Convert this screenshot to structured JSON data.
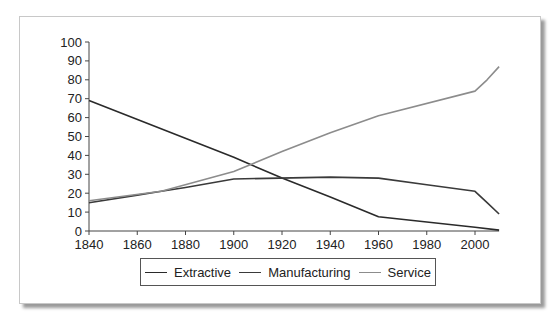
{
  "chart_data": {
    "type": "line",
    "title": "",
    "xlabel": "",
    "ylabel": "",
    "xlim": [
      1840,
      2010
    ],
    "ylim": [
      0,
      100
    ],
    "grid": false,
    "legend_position": "bottom",
    "x_ticks": [
      1840,
      1860,
      1880,
      1900,
      1920,
      1940,
      1960,
      1980,
      2000
    ],
    "y_ticks": [
      0,
      10,
      20,
      30,
      40,
      50,
      60,
      70,
      80,
      90,
      100
    ],
    "series": [
      {
        "name": "Extractive",
        "color": "#2a2a2a",
        "points": [
          [
            1840,
            69
          ],
          [
            1900,
            39
          ],
          [
            1920,
            28
          ],
          [
            1940,
            18
          ],
          [
            1960,
            7.5
          ],
          [
            2000,
            2
          ],
          [
            2010,
            0.5
          ]
        ]
      },
      {
        "name": "Manufacturing",
        "color": "#3a3a3a",
        "points": [
          [
            1840,
            15
          ],
          [
            1860,
            19
          ],
          [
            1870,
            21
          ],
          [
            1880,
            23
          ],
          [
            1900,
            27.5
          ],
          [
            1940,
            28.5
          ],
          [
            1960,
            28
          ],
          [
            1980,
            24.5
          ],
          [
            2000,
            21
          ],
          [
            2005,
            15
          ],
          [
            2010,
            9
          ]
        ]
      },
      {
        "name": "Service",
        "color": "#8c8c8c",
        "points": [
          [
            1840,
            16
          ],
          [
            1870,
            21
          ],
          [
            1900,
            31.5
          ],
          [
            1920,
            42
          ],
          [
            1940,
            52
          ],
          [
            1960,
            61
          ],
          [
            2000,
            74
          ],
          [
            2005,
            80
          ],
          [
            2010,
            87
          ]
        ]
      }
    ]
  },
  "legend": {
    "items": [
      {
        "label": "Extractive",
        "color": "#2a2a2a"
      },
      {
        "label": "Manufacturing",
        "color": "#3a3a3a"
      },
      {
        "label": "Service",
        "color": "#8c8c8c"
      }
    ]
  }
}
